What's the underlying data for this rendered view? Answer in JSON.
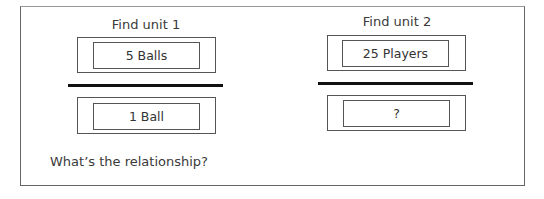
{
  "units": [
    {
      "title": "Find unit 1",
      "numerator": "5 Balls",
      "denominator": "1 Ball"
    },
    {
      "title": "Find unit 2",
      "numerator": "25 Players",
      "denominator": "?"
    }
  ],
  "prompt": "What’s the relationship?",
  "colors": {
    "border": "#555555",
    "fraction_bar": "#111111",
    "text": "#333333"
  }
}
